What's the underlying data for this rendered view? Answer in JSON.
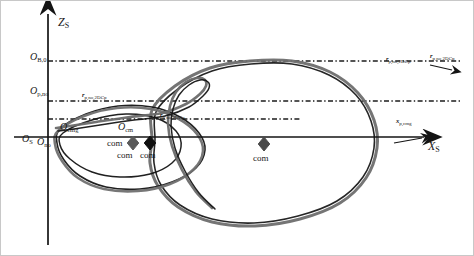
{
  "figure": {
    "background_color": "#ffffff",
    "line_color": "#1a1a1a",
    "curve_gray": "#6e6e6e",
    "curve_dark": "#141414"
  },
  "axes": {
    "vertical": {
      "name": "Z",
      "subscript": "S",
      "x": 48,
      "top_y": 14,
      "bottom_y": 245,
      "label_x": 58,
      "label_y": 16
    },
    "horizontal": {
      "name": "X",
      "subscript": "S",
      "y": 137,
      "left_x": 14,
      "right_x": 424,
      "label_x": 428,
      "label_y": 140
    },
    "origin": {
      "name": "O",
      "subscript": "S",
      "x": 22,
      "y": 134
    }
  },
  "reference_lines": [
    {
      "name": "upper-dashdot-line",
      "y": 61,
      "x_start": 48,
      "x_end": 460
    },
    {
      "name": "middle-dashdot-line",
      "y": 101,
      "x_start": 48,
      "x_end": 460
    },
    {
      "name": "lower-dashdot-line",
      "y": 119,
      "x_start": 48,
      "x_end": 300
    }
  ],
  "origin_labels": [
    {
      "name": "origin-label-upper",
      "text": "O",
      "sub": "B,0",
      "x": 30,
      "y": 52
    },
    {
      "name": "origin-label-middle",
      "text": "O",
      "sub": "p,no",
      "x": 30,
      "y": 86
    },
    {
      "name": "origin-label-lower",
      "text": "O",
      "sub": "cmg",
      "x": 60,
      "y": 122
    },
    {
      "name": "origin-label-inner",
      "text": "O",
      "sub": "no",
      "x": 37,
      "y": 137
    },
    {
      "name": "origin-label-mid-right",
      "text": "O",
      "sub": "cm",
      "x": 118,
      "y": 122
    }
  ],
  "vector_labels": [
    {
      "name": "vector-label-left",
      "text": "r",
      "sub": "p,no,2DCp",
      "x": 82,
      "y": 92
    },
    {
      "name": "vector-label-center",
      "text": "r",
      "sub": "p,no,2DCp",
      "x": 160,
      "y": 112
    },
    {
      "name": "vector-label-right-a",
      "text": "r",
      "sub": "p,no,2DCp",
      "x": 386,
      "y": 56
    },
    {
      "name": "vector-label-right-b",
      "text": "r",
      "sub": "p,no,2DCp",
      "x": 430,
      "y": 53
    },
    {
      "name": "vector-label-x-axis",
      "text": "x",
      "sub": "p,cmg",
      "x": 396,
      "y": 118
    }
  ],
  "com_markers": [
    {
      "name": "com-marker-left-gray",
      "cx": 133,
      "cy": 143,
      "size": 7,
      "color": "#5a5a5a",
      "label": "com",
      "label_x": 107,
      "label_y": 139
    },
    {
      "name": "com-marker-left-dark",
      "cx": 150,
      "cy": 143,
      "size": 7,
      "color": "#101010",
      "label": "com",
      "label_x": 140,
      "label_y": 151
    },
    {
      "name": "com-marker-left-under",
      "cx": 0,
      "cy": 0,
      "size": 0,
      "color": "#101010",
      "label": "com",
      "label_x": 117,
      "label_y": 151
    },
    {
      "name": "com-marker-center",
      "cx": 264,
      "cy": 144,
      "size": 7,
      "color": "#4a4a4a",
      "label": "com",
      "label_x": 253,
      "label_y": 154
    }
  ],
  "arrow_markers": [
    {
      "name": "arrow-marker-upper-right",
      "x": 452,
      "y": 68
    },
    {
      "name": "arrow-marker-x-axis-tip",
      "x": 424,
      "y": 137
    }
  ],
  "chart_data": {
    "type": "line",
    "title": "",
    "xlabel": "X_S",
    "ylabel": "Z_S",
    "grid": false,
    "legend": "none",
    "series": [
      {
        "name": "outer-large-loop-gray",
        "color": "#6e6e6e",
        "width": 3.0,
        "closed": true,
        "points": [
          [
            152,
            110
          ],
          [
            175,
            86
          ],
          [
            210,
            68
          ],
          [
            250,
            61
          ],
          [
            292,
            61
          ],
          [
            330,
            72
          ],
          [
            358,
            93
          ],
          [
            374,
            120
          ],
          [
            377,
            148
          ],
          [
            366,
            178
          ],
          [
            340,
            203
          ],
          [
            300,
            219
          ],
          [
            255,
            226
          ],
          [
            212,
            222
          ],
          [
            178,
            207
          ],
          [
            158,
            186
          ],
          [
            150,
            163
          ],
          [
            152,
            140
          ],
          [
            152,
            110
          ]
        ]
      },
      {
        "name": "outer-large-loop-dark",
        "color": "#1a1a1a",
        "width": 1.6,
        "closed": true,
        "points": [
          [
            156,
            112
          ],
          [
            178,
            89
          ],
          [
            212,
            71
          ],
          [
            251,
            64
          ],
          [
            292,
            64
          ],
          [
            329,
            75
          ],
          [
            356,
            95
          ],
          [
            371,
            121
          ],
          [
            374,
            148
          ],
          [
            363,
            177
          ],
          [
            337,
            201
          ],
          [
            298,
            216
          ],
          [
            254,
            223
          ],
          [
            212,
            219
          ],
          [
            180,
            205
          ],
          [
            161,
            185
          ],
          [
            154,
            163
          ],
          [
            155,
            140
          ],
          [
            156,
            112
          ]
        ]
      },
      {
        "name": "mid-loop-dark",
        "color": "#141414",
        "width": 1.6,
        "closed": true,
        "points": [
          [
            60,
            129
          ],
          [
            86,
            114
          ],
          [
            118,
            106
          ],
          [
            152,
            107
          ],
          [
            180,
            117
          ],
          [
            199,
            133
          ],
          [
            205,
            150
          ],
          [
            196,
            168
          ],
          [
            172,
            182
          ],
          [
            140,
            189
          ],
          [
            106,
            187
          ],
          [
            80,
            176
          ],
          [
            64,
            160
          ],
          [
            57,
            143
          ],
          [
            60,
            129
          ]
        ]
      },
      {
        "name": "mid-loop-gray",
        "color": "#707070",
        "width": 2.6,
        "closed": true,
        "points": [
          [
            58,
            131
          ],
          [
            84,
            116
          ],
          [
            117,
            108
          ],
          [
            151,
            109
          ],
          [
            179,
            119
          ],
          [
            197,
            134
          ],
          [
            203,
            151
          ],
          [
            194,
            169
          ],
          [
            170,
            184
          ],
          [
            138,
            191
          ],
          [
            104,
            189
          ],
          [
            78,
            178
          ],
          [
            62,
            161
          ],
          [
            55,
            144
          ],
          [
            58,
            131
          ]
        ]
      },
      {
        "name": "inner-loop-dark",
        "color": "#141414",
        "width": 1.5,
        "closed": true,
        "points": [
          [
            63,
            133
          ],
          [
            92,
            120
          ],
          [
            126,
            114
          ],
          [
            156,
            118
          ],
          [
            176,
            131
          ],
          [
            181,
            147
          ],
          [
            172,
            163
          ],
          [
            150,
            174
          ],
          [
            120,
            177
          ],
          [
            92,
            172
          ],
          [
            70,
            159
          ],
          [
            60,
            145
          ],
          [
            63,
            133
          ]
        ]
      },
      {
        "name": "cusp-tail-gray",
        "color": "#6a6a6a",
        "width": 2.6,
        "closed": false,
        "points": [
          [
            56,
            128
          ],
          [
            70,
            126
          ],
          [
            96,
            122
          ],
          [
            130,
            117
          ],
          [
            162,
            113
          ],
          [
            186,
            104
          ],
          [
            200,
            94
          ],
          [
            206,
            86
          ],
          [
            205,
            80
          ],
          [
            197,
            78
          ],
          [
            186,
            82
          ],
          [
            176,
            92
          ],
          [
            170,
            106
          ],
          [
            168,
            124
          ],
          [
            172,
            146
          ],
          [
            182,
            170
          ],
          [
            196,
            192
          ],
          [
            212,
            208
          ]
        ]
      },
      {
        "name": "cusp-tail-dark",
        "color": "#161616",
        "width": 1.5,
        "closed": false,
        "points": [
          [
            58,
            131
          ],
          [
            74,
            129
          ],
          [
            100,
            125
          ],
          [
            134,
            120
          ],
          [
            165,
            116
          ],
          [
            189,
            107
          ],
          [
            203,
            96
          ],
          [
            209,
            88
          ],
          [
            208,
            82
          ],
          [
            200,
            80
          ],
          [
            189,
            85
          ],
          [
            179,
            95
          ],
          [
            173,
            109
          ],
          [
            171,
            126
          ],
          [
            175,
            148
          ],
          [
            185,
            171
          ],
          [
            199,
            193
          ],
          [
            215,
            209
          ]
        ]
      }
    ]
  }
}
